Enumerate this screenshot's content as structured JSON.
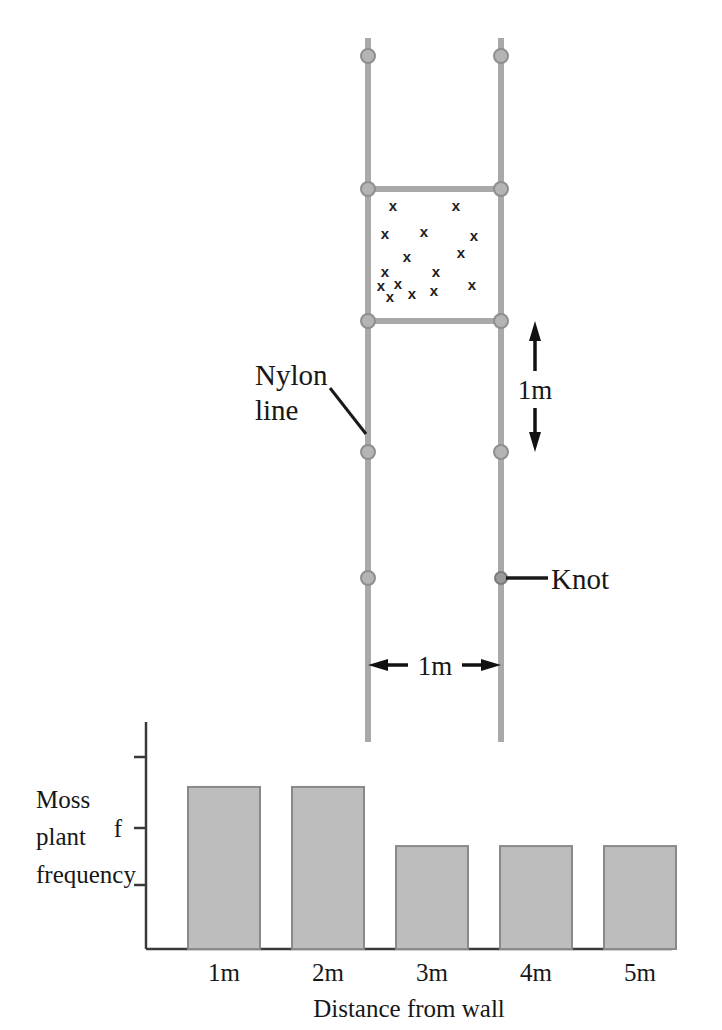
{
  "figure": {
    "title_visible": false,
    "colors": {
      "line_gray": "#a9a9a9",
      "knot_gray": "#9a9a9a",
      "bar_fill": "#bdbdbd",
      "bar_stroke": "#8a8a8a",
      "axis": "#3a3a3a",
      "text": "#171717"
    }
  },
  "diagram": {
    "nylon_label_line1": "Nylon",
    "nylon_label_line2": "line",
    "knot_label": "Knot",
    "vertical_dimension_label": "1m",
    "horizontal_dimension_label": "1m",
    "quadrat_marks_symbol": "x",
    "quadrat_mark_count": 16,
    "knot_count": 10,
    "knots_per_line": 5,
    "quadrat_marks": [
      {
        "x": 393,
        "y": 211
      },
      {
        "x": 456,
        "y": 211
      },
      {
        "x": 385,
        "y": 239
      },
      {
        "x": 424,
        "y": 237
      },
      {
        "x": 474,
        "y": 241
      },
      {
        "x": 407,
        "y": 262
      },
      {
        "x": 461,
        "y": 258
      },
      {
        "x": 385,
        "y": 277
      },
      {
        "x": 436,
        "y": 277
      },
      {
        "x": 381,
        "y": 291
      },
      {
        "x": 398,
        "y": 289
      },
      {
        "x": 472,
        "y": 290
      },
      {
        "x": 390,
        "y": 302
      },
      {
        "x": 412,
        "y": 299
      },
      {
        "x": 434,
        "y": 296
      }
    ]
  },
  "chart_data": {
    "type": "bar",
    "categories": [
      "1m",
      "2m",
      "3m",
      "4m",
      "5m"
    ],
    "values": [
      0.74,
      0.74,
      0.47,
      0.47,
      0.47
    ],
    "title": "",
    "xlabel": "Distance from wall",
    "ylabel": "Moss plant frequency",
    "ylabel_lines": [
      "Moss",
      "plant",
      "frequency"
    ],
    "y_tick_label": "f",
    "y_tick_count": 3,
    "ylim": [
      0,
      1
    ],
    "grid": false,
    "legend": false
  }
}
